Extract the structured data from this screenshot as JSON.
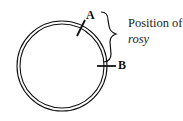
{
  "diagram": {
    "labels": {
      "point_a": "A",
      "point_b": "B"
    },
    "caption": {
      "line1": "Position of",
      "line2": "rosy"
    },
    "shapes": {
      "ring": "double-circle",
      "markers": [
        "tick-A",
        "tick-B"
      ],
      "bracket": "curly-brace"
    },
    "colors": {
      "stroke": "#111111",
      "background": "#ffffff"
    }
  }
}
